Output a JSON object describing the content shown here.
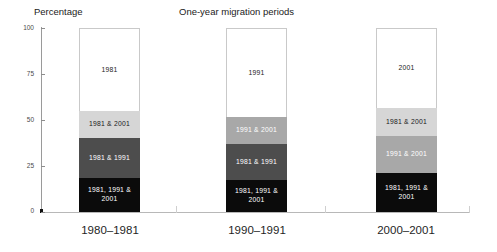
{
  "header": {
    "axis_title": "Percentage",
    "chart_title": "One-year migration periods"
  },
  "chart_data": {
    "type": "bar",
    "subtype": "stacked-bar-100",
    "title": "One-year migration periods",
    "xlabel": "",
    "ylabel": "Percentage",
    "ylim": [
      0,
      100
    ],
    "yticks": [
      0,
      25,
      50,
      75,
      100
    ],
    "ytick_labels": [
      "0",
      "25",
      "50",
      "75",
      "100"
    ],
    "grid": false,
    "legend": "none (in-segment labels)",
    "categories": [
      "1980–1981",
      "1990–1991",
      "2000–2001"
    ],
    "series": [
      {
        "name": "1981, 1991 & 2001",
        "color": "#0b0b0b",
        "values": [
          18.5,
          17.5,
          21.0
        ],
        "labels": [
          "1981, 1991  &\n2001",
          "1981, 1991\n&   2001",
          "1981, 1991\n&  2001"
        ]
      },
      {
        "name": "1981 & 1991",
        "color": "#4d4d4d",
        "values": [
          21.5,
          19.5,
          0
        ],
        "labels": [
          "1981 &  1991",
          "1981 & 1991",
          ""
        ]
      },
      {
        "name": "1991 & 2001",
        "color": "#a8a8a8",
        "values": [
          0,
          14.5,
          20.3
        ],
        "labels": [
          "",
          "1991  & 2001",
          "1991  &  2001"
        ]
      },
      {
        "name": "1981 & 2001",
        "color": "#d6d6d6",
        "values": [
          15.0,
          0,
          15.2
        ],
        "labels": [
          "1981 & 2001",
          "",
          "1981 & 2001"
        ]
      },
      {
        "name": "single year",
        "color": "#ffffff",
        "values": [
          45.0,
          48.5,
          43.5
        ],
        "labels": [
          "1981",
          "1991",
          "2001"
        ]
      }
    ],
    "bars": [
      {
        "category": "1980–1981",
        "segments": [
          {
            "label": "1981",
            "from": 55.0,
            "to": 100.0,
            "style": "white"
          },
          {
            "label": "1981 & 2001",
            "from": 40.0,
            "to": 55.0,
            "style": "light"
          },
          {
            "label": "1981 &  1991",
            "from": 18.5,
            "to": 40.0,
            "style": "dark"
          },
          {
            "label": "1981, 1991  & 2001",
            "from": 0.0,
            "to": 18.5,
            "style": "black"
          }
        ]
      },
      {
        "category": "1990–1991",
        "segments": [
          {
            "label": "1991",
            "from": 51.5,
            "to": 100.0,
            "style": "white"
          },
          {
            "label": "1991  & 2001",
            "from": 37.0,
            "to": 51.5,
            "style": "mid"
          },
          {
            "label": "1981 & 1991",
            "from": 17.5,
            "to": 37.0,
            "style": "dark"
          },
          {
            "label": "1981, 1991 &   2001",
            "from": 0.0,
            "to": 17.5,
            "style": "black"
          }
        ]
      },
      {
        "category": "2000–2001",
        "segments": [
          {
            "label": "2001",
            "from": 56.5,
            "to": 100.0,
            "style": "white"
          },
          {
            "label": "1981 & 2001",
            "from": 41.3,
            "to": 56.5,
            "style": "light"
          },
          {
            "label": "1991  &  2001",
            "from": 21.0,
            "to": 41.3,
            "style": "mid"
          },
          {
            "label": "1981, 1991 &  2001",
            "from": 0.0,
            "to": 21.0,
            "style": "black"
          }
        ]
      }
    ]
  }
}
